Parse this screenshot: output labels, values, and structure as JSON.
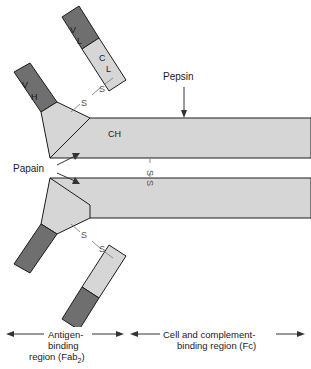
{
  "figure": {
    "domains": {
      "v_l": "V",
      "v_l_sub": "L",
      "c_l": "C",
      "c_l_sub": "L",
      "v_h": "V",
      "v_h_sub": "H",
      "c_h": "CH"
    },
    "disulfides": {
      "label_s": "S",
      "interchain_upper": [
        "S",
        "S"
      ],
      "interchain_lower": [
        "S",
        "S"
      ],
      "hinge": [
        "S",
        "S"
      ]
    },
    "enzymes": {
      "pepsin": "Pepsin",
      "papain": "Papain"
    },
    "regions": {
      "left": {
        "line1": "Antigen-",
        "line2": "binding",
        "line3_pre": "region (Fab",
        "line3_sub": "2",
        "line3_post": ")"
      },
      "right": {
        "line1": "Cell and complement-",
        "line2": "binding region (Fc)"
      }
    },
    "colors": {
      "variable_domain": "#6f6f6f",
      "constant_domain": "#d6d6d6",
      "outline": "#1c1c1c",
      "disulfide": "#8a8a8a",
      "text": "#1a1a1a",
      "background": "#ffffff"
    }
  }
}
